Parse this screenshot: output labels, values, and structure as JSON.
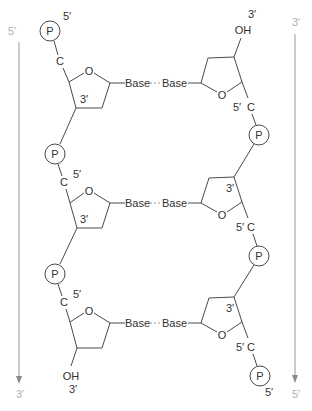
{
  "diagram": {
    "left_strand": {
      "direction_top_label": "5′",
      "direction_bottom_label": "3′",
      "top_end_label": "5′",
      "bottom_end_label": "3′",
      "bottom_end_group": "OH",
      "nucleotides": [
        {
          "phosphate": "P",
          "carbon": "C",
          "c5_label": "5′",
          "c3_label": "3′",
          "ring_oxygen": "O",
          "base": "Base"
        },
        {
          "phosphate": "P",
          "carbon": "C",
          "c5_label": "5′",
          "c3_label": "3′",
          "ring_oxygen": "O",
          "base": "Base"
        },
        {
          "phosphate": "P",
          "carbon": "C",
          "c5_label": "5′",
          "c3_label": "",
          "ring_oxygen": "O",
          "base": "Base"
        }
      ]
    },
    "right_strand": {
      "direction_top_label": "3′",
      "direction_bottom_label": "5′",
      "top_end_label": "3′",
      "top_end_group": "OH",
      "bottom_end_label": "5′",
      "nucleotides": [
        {
          "phosphate": "P",
          "carbon": "C",
          "c5_label": "5′",
          "c3_label": "",
          "ring_oxygen": "O",
          "base": "Base"
        },
        {
          "phosphate": "P",
          "carbon": "C",
          "c5_label": "5′",
          "c3_label": "3′",
          "ring_oxygen": "O",
          "base": "Base"
        },
        {
          "phosphate": "P",
          "carbon": "C",
          "c5_label": "5′",
          "c3_label": "3′",
          "ring_oxygen": "O",
          "base": "Base"
        }
      ]
    },
    "colors": {
      "line": "#4a4a4a",
      "text": "#333333",
      "arrow": "#a8a8a8",
      "hbond": "#9a9a9a"
    }
  }
}
